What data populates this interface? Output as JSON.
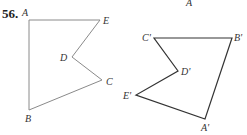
{
  "problem_number": "56.",
  "figure_original": {
    "stroke": "#8a8a8a",
    "points": [
      {
        "label": "A",
        "x": 29,
        "y": 20,
        "lx": 22,
        "ly": 16
      },
      {
        "label": "E",
        "x": 100,
        "y": 20,
        "lx": 103,
        "ly": 24
      },
      {
        "label": "D",
        "x": 72,
        "y": 57,
        "lx": 60,
        "ly": 61
      },
      {
        "label": "C",
        "x": 102,
        "y": 80,
        "lx": 106,
        "ly": 85
      },
      {
        "label": "B",
        "x": 29,
        "y": 110,
        "lx": 25,
        "ly": 122
      }
    ]
  },
  "figure_image": {
    "stroke": "#333333",
    "points": [
      {
        "label": "C'",
        "x": 154,
        "y": 38,
        "lx": 142,
        "ly": 41
      },
      {
        "label": "B'",
        "x": 232,
        "y": 38,
        "lx": 234,
        "ly": 41
      },
      {
        "label": "D'",
        "x": 178,
        "y": 71,
        "lx": 181,
        "ly": 75
      },
      {
        "label": "E'",
        "x": 136,
        "y": 95,
        "lx": 123,
        "ly": 99
      },
      {
        "label": "A'",
        "x": 205,
        "y": 119,
        "lx": 201,
        "ly": 131
      }
    ]
  },
  "stray_label": {
    "label": "A",
    "x": 186,
    "y": 6
  }
}
